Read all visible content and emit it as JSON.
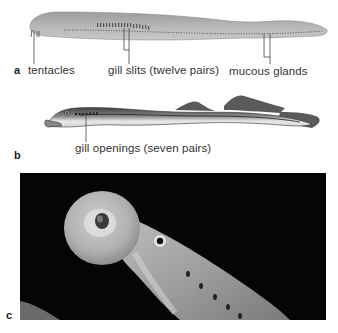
{
  "figure": {
    "panels": [
      {
        "letter": "a",
        "subject": "hagfish",
        "labels": {
          "tentacles": "tentacles",
          "gill_slits": "gill slits (twelve pairs)",
          "mucous_glands": "mucous glands"
        }
      },
      {
        "letter": "b",
        "subject": "lamprey",
        "labels": {
          "gill_openings": "gill openings (seven pairs)"
        }
      },
      {
        "letter": "c",
        "subject": "lamprey-photo-oral-disk"
      }
    ],
    "colors": {
      "hagfish_body": "#a9a9a9",
      "hagfish_light": "#c8c8c8",
      "lamprey_dark": "#4d4d4d",
      "lamprey_belly": "#e6e6e6",
      "photo_bg": "#050505",
      "leader_line": "#444444"
    }
  }
}
